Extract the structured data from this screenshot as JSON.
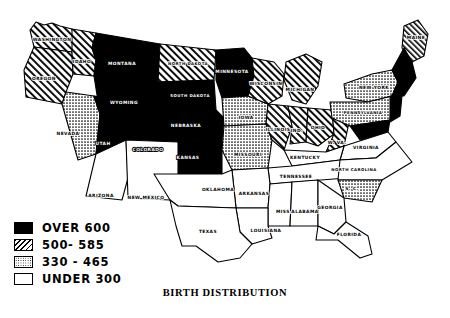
{
  "title": "BIRTH DISTRIBUTION",
  "legend": {
    "items": [
      {
        "label": "OVER 600",
        "pattern": "solid-black",
        "range_low": 600,
        "range_high": null
      },
      {
        "label": "500- 585",
        "pattern": "diagonal-hatch",
        "range_low": 500,
        "range_high": 585
      },
      {
        "label": "330 - 465",
        "pattern": "stipple",
        "range_low": 330,
        "range_high": 465
      },
      {
        "label": "UNDER 300",
        "pattern": "white",
        "range_low": null,
        "range_high": 300
      }
    ]
  },
  "colors": {
    "ink": "#000000",
    "paper": "#ffffff"
  },
  "chart_data": {
    "type": "map",
    "title": "BIRTH DISTRIBUTION",
    "region": "United States",
    "classes": [
      "OVER 600",
      "500- 585",
      "330 - 465",
      "UNDER 300"
    ],
    "states": [
      {
        "name": "WASHINGTON",
        "label": "WASHINGTON",
        "class": "500- 585",
        "lx": 52,
        "ly": 40
      },
      {
        "name": "OREGON",
        "label": "OREGON",
        "class": "500- 585",
        "lx": 44,
        "ly": 79
      },
      {
        "name": "IDAHO",
        "label": "IDAHO",
        "class": "500- 585",
        "lx": 82,
        "ly": 62
      },
      {
        "name": "MONTANA",
        "label": "MONTANA",
        "class": "OVER 600",
        "lx": 122,
        "ly": 64
      },
      {
        "name": "NORTH DAKOTA",
        "label": "NORTH DAKOTA",
        "class": "500- 585",
        "lx": 188,
        "ly": 64
      },
      {
        "name": "SOUTH DAKOTA",
        "label": "SOUTH DAKOTA",
        "class": "OVER 600",
        "lx": 190,
        "ly": 96
      },
      {
        "name": "WYOMING",
        "label": "WYOMING",
        "class": "OVER 600",
        "lx": 124,
        "ly": 103
      },
      {
        "name": "NEVADA",
        "label": "NEVADA",
        "class": "330 - 465",
        "lx": 68,
        "ly": 134
      },
      {
        "name": "UTAH",
        "label": "UTAH",
        "class": "OVER 600",
        "lx": 103,
        "ly": 144
      },
      {
        "name": "COLORADO",
        "label": "COLORADO",
        "class": "OVER 600",
        "lx": 148,
        "ly": 150
      },
      {
        "name": "NEBRASKA",
        "label": "NEBRASKA",
        "class": "OVER 600",
        "lx": 186,
        "ly": 126
      },
      {
        "name": "IOWA",
        "label": "IOWA",
        "class": "330 - 465",
        "lx": 246,
        "ly": 118
      },
      {
        "name": "MINNESOTA",
        "label": "MINNESOTA",
        "class": "OVER 600",
        "lx": 232,
        "ly": 72
      },
      {
        "name": "WISCONSIN",
        "label": "WISCONSIN",
        "class": "500- 585",
        "lx": 266,
        "ly": 84
      },
      {
        "name": "ILLINOIS",
        "label": "ILLINOIS",
        "class": "500- 585",
        "lx": 278,
        "ly": 130
      },
      {
        "name": "KANSAS",
        "label": "KANSAS",
        "class": "OVER 600",
        "lx": 188,
        "ly": 158
      },
      {
        "name": "MISSOURI",
        "label": "MISSOURI",
        "class": "330 - 465",
        "lx": 248,
        "ly": 155
      },
      {
        "name": "ARIZONA",
        "label": "ARIZONA",
        "class": "UNDER 300",
        "lx": 101,
        "ly": 196
      },
      {
        "name": "NEW MEXICO",
        "label": "NEW MEXICO",
        "class": "UNDER 300",
        "lx": 146,
        "ly": 198
      },
      {
        "name": "OKLAHOMA",
        "label": "OKLAHOMA",
        "class": "UNDER 300",
        "lx": 218,
        "ly": 190
      },
      {
        "name": "TEXAS",
        "label": "TEXAS",
        "class": "UNDER 300",
        "lx": 208,
        "ly": 232
      },
      {
        "name": "ARKANSAS",
        "label": "ARKANSAS",
        "class": "UNDER 300",
        "lx": 254,
        "ly": 194
      },
      {
        "name": "LOUISIANA",
        "label": "LOUISIANA",
        "class": "UNDER 300",
        "lx": 266,
        "ly": 231
      },
      {
        "name": "MISSISSIPPI",
        "label": "MISS.",
        "class": "UNDER 300",
        "lx": 284,
        "ly": 212
      },
      {
        "name": "ALABAMA",
        "label": "ALABAMA",
        "class": "UNDER 300",
        "lx": 305,
        "ly": 212
      },
      {
        "name": "GEORGIA",
        "label": "GEORGIA",
        "class": "UNDER 300",
        "lx": 330,
        "ly": 208
      },
      {
        "name": "FLORIDA",
        "label": "FLORIDA",
        "class": "UNDER 300",
        "lx": 349,
        "ly": 235
      },
      {
        "name": "TENNESSEE",
        "label": "TENNESSEE",
        "class": "UNDER 300",
        "lx": 296,
        "ly": 177
      },
      {
        "name": "KENTUCKY",
        "label": "KENTUCKY",
        "class": "UNDER 300",
        "lx": 305,
        "ly": 158
      },
      {
        "name": "SOUTH CAROLINA",
        "label": "S. C.",
        "class": "330 - 465",
        "lx": 352,
        "ly": 189
      },
      {
        "name": "NORTH CAROLINA",
        "label": "NORTH CAROLINA",
        "class": "UNDER 300",
        "lx": 354,
        "ly": 170
      },
      {
        "name": "VIRGINIA",
        "label": "VIRGINIA",
        "class": "UNDER 300",
        "lx": 366,
        "ly": 148
      },
      {
        "name": "WEST VIRGINIA",
        "label": "W. VA.",
        "class": "500- 585",
        "lx": 337,
        "ly": 143
      },
      {
        "name": "OHIO",
        "label": "OHIO",
        "class": "500- 585",
        "lx": 318,
        "ly": 128
      },
      {
        "name": "INDIANA",
        "label": "IND.",
        "class": "500- 585",
        "lx": 297,
        "ly": 131
      },
      {
        "name": "MICHIGAN",
        "label": "MICHIGAN",
        "class": "500- 585",
        "lx": 300,
        "ly": 90
      },
      {
        "name": "PENNSYLVANIA",
        "label": "PENNSYLVANIA",
        "class": "330 - 465",
        "lx": 363,
        "ly": 113
      },
      {
        "name": "NEW YORK",
        "label": "NEW YORK",
        "class": "330 - 465",
        "lx": 374,
        "ly": 88
      },
      {
        "name": "MAINE",
        "label": "MAINE",
        "class": "500- 585",
        "lx": 416,
        "ly": 38
      },
      {
        "name": "NEW ENGLAND",
        "label": "",
        "class": "OVER 600",
        "lx": 0,
        "ly": 0
      }
    ]
  }
}
